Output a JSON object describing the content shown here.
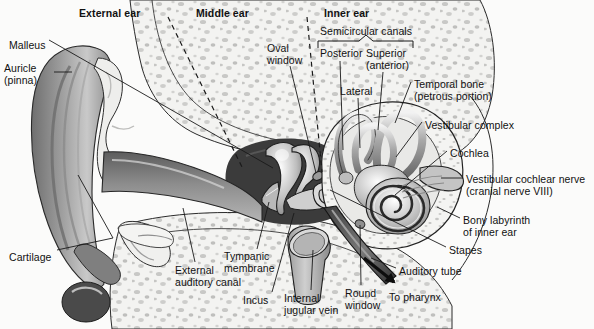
{
  "figure": {
    "title_hidden": "Anatomy of the human ear",
    "background_color": "#fbfbfa",
    "line_color": "#1a1a1a"
  },
  "sections": [
    {
      "name": "external-ear",
      "label": "External ear",
      "x": 79,
      "y": 8
    },
    {
      "name": "middle-ear",
      "label": "Middle ear",
      "x": 196,
      "y": 8
    },
    {
      "name": "inner-ear",
      "label": "Inner ear",
      "x": 324,
      "y": 8
    }
  ],
  "bracket": {
    "label": "Semicircular canals",
    "label_x": 320,
    "label_y": 26,
    "left_x": 318,
    "right_x": 413,
    "y": 41,
    "caret_x": 366
  },
  "labels": [
    {
      "name": "label-malleus",
      "text": "Malleus",
      "x": 9,
      "y": 40,
      "align": "left"
    },
    {
      "name": "label-auricle",
      "text": "Auricle\n(pinna)",
      "x": 4,
      "y": 63,
      "align": "left"
    },
    {
      "name": "label-cartilage",
      "text": "Cartilage",
      "x": 9,
      "y": 252,
      "align": "left"
    },
    {
      "name": "label-external-auditory-canal",
      "text": "External\nauditory canal",
      "x": 175,
      "y": 265,
      "align": "left"
    },
    {
      "name": "label-tympanic-membrane",
      "text": "Tympanic\nmembrane",
      "x": 224,
      "y": 251,
      "align": "left"
    },
    {
      "name": "label-incus",
      "text": "Incus",
      "x": 243,
      "y": 295,
      "align": "left"
    },
    {
      "name": "label-internal-jugular-vein",
      "text": "Internal\njugular vein",
      "x": 284,
      "y": 293,
      "align": "left"
    },
    {
      "name": "label-oval-window",
      "text": "Oval\nwindow",
      "x": 267,
      "y": 43,
      "align": "left"
    },
    {
      "name": "label-posterior",
      "text": "Posterior",
      "x": 320,
      "y": 48,
      "align": "left"
    },
    {
      "name": "label-superior",
      "text": "Superior\n(anterior)",
      "x": 366,
      "y": 48,
      "align": "left"
    },
    {
      "name": "label-lateral",
      "text": "Lateral",
      "x": 340,
      "y": 86,
      "align": "left"
    },
    {
      "name": "label-temporal-bone",
      "text": "Temporal bone\n(petrous portion)",
      "x": 414,
      "y": 79,
      "align": "left"
    },
    {
      "name": "label-vestibular-complex",
      "text": "Vestibular complex",
      "x": 425,
      "y": 120,
      "align": "left"
    },
    {
      "name": "label-cochlea",
      "text": "Cochlea",
      "x": 450,
      "y": 148,
      "align": "left"
    },
    {
      "name": "label-vestibular-cochlear-nerve",
      "text": "Vestibular cochlear nerve\n(cranial nerve VIII)",
      "x": 466,
      "y": 174,
      "align": "left"
    },
    {
      "name": "label-bony-labyrinth",
      "text": "Bony labyrinth\nof inner ear",
      "x": 463,
      "y": 215,
      "align": "left"
    },
    {
      "name": "label-stapes",
      "text": "Stapes",
      "x": 449,
      "y": 245,
      "align": "left"
    },
    {
      "name": "label-auditory-tube",
      "text": "Auditory tube",
      "x": 399,
      "y": 266,
      "align": "left"
    },
    {
      "name": "label-round-window",
      "text": "Round\nwindow",
      "x": 345,
      "y": 288,
      "align": "left"
    },
    {
      "name": "label-to-pharynx",
      "text": "To pharynx",
      "x": 389,
      "y": 292,
      "align": "left"
    }
  ],
  "dividers": [
    {
      "name": "divider-external-middle",
      "x1": 168,
      "y1": 17,
      "x2": 242,
      "y2": 167
    },
    {
      "name": "divider-middle-inner",
      "x1": 307,
      "y1": 17,
      "x2": 322,
      "y2": 172
    }
  ],
  "leaders": [
    {
      "name": "leader-malleus",
      "pts": "49,40 273,168"
    },
    {
      "name": "leader-auricle",
      "pts": "54,72 72,72"
    },
    {
      "name": "leader-cartilage",
      "pts": "57,250 113,238 78,175"
    },
    {
      "name": "leader-external-auditory-canal",
      "pts": "195,262 183,208"
    },
    {
      "name": "leader-tympanic-membrane",
      "pts": "257,249 269,202"
    },
    {
      "name": "leader-incus",
      "pts": "272,292 294,213"
    },
    {
      "name": "leader-internal-jugular-vein",
      "pts": "311,290 313,250"
    },
    {
      "name": "leader-oval-window",
      "pts": "290,66 316,173"
    },
    {
      "name": "leader-posterior",
      "pts": "340,61 343,150"
    },
    {
      "name": "leader-superior",
      "pts": "383,72 378,130"
    },
    {
      "name": "leader-lateral",
      "pts": "358,98 360,148"
    },
    {
      "name": "leader-temporal-bone",
      "pts": "411,82 395,123"
    },
    {
      "name": "leader-vestibular-complex",
      "pts": "422,122 396,157"
    },
    {
      "name": "leader-cochlea",
      "pts": "447,151 395,195"
    },
    {
      "name": "leader-vestibular-cochlear-nerve",
      "pts": "463,178 441,178"
    },
    {
      "name": "leader-bony-labyrinth",
      "pts": "460,218 437,207"
    },
    {
      "name": "leader-stapes",
      "pts": "446,247 330,190"
    },
    {
      "name": "leader-auditory-tube",
      "pts": "396,268 371,258"
    },
    {
      "name": "leader-round-window",
      "pts": "361,285 360,225"
    }
  ],
  "arrow": {
    "name": "to-pharynx-arrow",
    "x1": 364,
    "y1": 258,
    "x2": 394,
    "y2": 282
  }
}
